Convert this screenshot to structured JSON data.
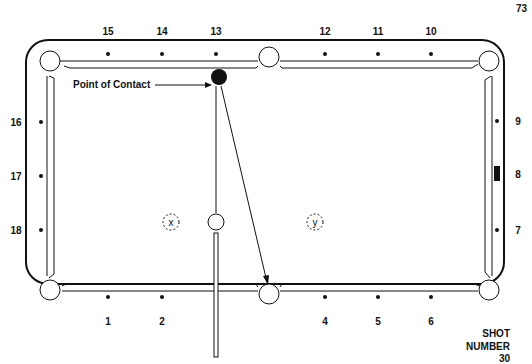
{
  "page_number": "73",
  "title_block": {
    "line1": "SHOT",
    "line2": "NUMBER",
    "line3": "30"
  },
  "annotation": {
    "point_of_contact": "Point of Contact"
  },
  "diamonds": {
    "top": [
      "15",
      "14",
      "13",
      "12",
      "11",
      "10"
    ],
    "bottom": [
      "1",
      "2",
      "4",
      "5",
      "6"
    ],
    "left": [
      "16",
      "17",
      "18"
    ],
    "right": [
      "9",
      "8",
      "7"
    ]
  },
  "ball_labels": {
    "x": "x",
    "y": "y"
  },
  "colors": {
    "ink": "#111111",
    "paper": "#ffffff"
  }
}
